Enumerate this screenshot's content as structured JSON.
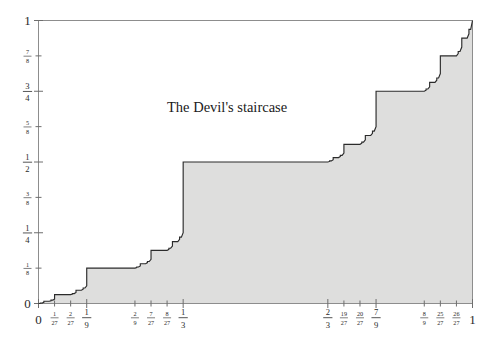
{
  "figure": {
    "title": "The Devil's staircase",
    "background_color": "#ffffff",
    "fill_color": "#dededd",
    "curve_color": "#2b2b2b",
    "axis_color": "#8d8d8d"
  },
  "chart_data": {
    "type": "line",
    "title": "The Devil's staircase",
    "xlabel": "",
    "ylabel": "",
    "xlim": [
      0,
      1
    ],
    "ylim": [
      0,
      1
    ],
    "grid": false,
    "legend": "none",
    "x_tick_labels": [
      "0",
      "1/27",
      "2/27",
      "1/9",
      "2/9",
      "7/27",
      "8/27",
      "1/3",
      "2/3",
      "19/27",
      "20/27",
      "7/9",
      "8/9",
      "25/27",
      "26/27",
      "1"
    ],
    "x_tick_values": [
      0,
      0.037037,
      0.074074,
      0.111111,
      0.222222,
      0.259259,
      0.296296,
      0.333333,
      0.666667,
      0.703704,
      0.740741,
      0.777778,
      0.888889,
      0.925926,
      0.962963,
      1
    ],
    "y_tick_labels": [
      "0",
      "1/8",
      "1/4",
      "3/8",
      "1/2",
      "5/8",
      "3/4",
      "7/8",
      "1"
    ],
    "y_tick_values": [
      0,
      0.125,
      0.25,
      0.375,
      0.5,
      0.625,
      0.75,
      0.875,
      1
    ],
    "plateaus": [
      {
        "x_start": 0.333333,
        "x_end": 0.666667,
        "y": 0.5
      },
      {
        "x_start": 0.111111,
        "x_end": 0.222222,
        "y": 0.25
      },
      {
        "x_start": 0.777778,
        "x_end": 0.888889,
        "y": 0.75
      },
      {
        "x_start": 0.037037,
        "x_end": 0.074074,
        "y": 0.125
      },
      {
        "x_start": 0.259259,
        "x_end": 0.296296,
        "y": 0.375
      },
      {
        "x_start": 0.703704,
        "x_end": 0.740741,
        "y": 0.625
      },
      {
        "x_start": 0.925926,
        "x_end": 0.962963,
        "y": 0.875
      }
    ],
    "series": [
      {
        "name": "Cantor function",
        "x": [
          0,
          1
        ],
        "y": [
          0,
          1
        ]
      }
    ]
  },
  "axes": {
    "y_ticks": [
      {
        "label": "0",
        "value": 0,
        "style": "whole"
      },
      {
        "label": "1/8",
        "num": "1",
        "den": "8",
        "value": 0.125,
        "style": "frac-small"
      },
      {
        "label": "1/4",
        "num": "1",
        "den": "4",
        "value": 0.25,
        "style": "frac-big"
      },
      {
        "label": "3/8",
        "num": "3",
        "den": "8",
        "value": 0.375,
        "style": "frac-small"
      },
      {
        "label": "1/2",
        "num": "1",
        "den": "2",
        "value": 0.5,
        "style": "frac-big"
      },
      {
        "label": "5/8",
        "num": "5",
        "den": "8",
        "value": 0.625,
        "style": "frac-small"
      },
      {
        "label": "3/4",
        "num": "3",
        "den": "4",
        "value": 0.75,
        "style": "frac-big"
      },
      {
        "label": "7/8",
        "num": "7",
        "den": "8",
        "value": 0.875,
        "style": "frac-small"
      },
      {
        "label": "1",
        "value": 1,
        "style": "whole"
      }
    ],
    "x_ticks": [
      {
        "label": "0",
        "value": 0,
        "style": "whole"
      },
      {
        "label": "1/27",
        "num": "1",
        "den": "27",
        "value": 0.037037,
        "style": "frac-small"
      },
      {
        "label": "2/27",
        "num": "2",
        "den": "27",
        "value": 0.074074,
        "style": "frac-small"
      },
      {
        "label": "1/9",
        "num": "1",
        "den": "9",
        "value": 0.111111,
        "style": "frac-big"
      },
      {
        "label": "2/9",
        "num": "2",
        "den": "9",
        "value": 0.222222,
        "style": "frac-small"
      },
      {
        "label": "7/27",
        "num": "7",
        "den": "27",
        "value": 0.259259,
        "style": "frac-small"
      },
      {
        "label": "8/27",
        "num": "8",
        "den": "27",
        "value": 0.296296,
        "style": "frac-small"
      },
      {
        "label": "1/3",
        "num": "1",
        "den": "3",
        "value": 0.333333,
        "style": "frac-big"
      },
      {
        "label": "2/3",
        "num": "2",
        "den": "3",
        "value": 0.666667,
        "style": "frac-big"
      },
      {
        "label": "19/27",
        "num": "19",
        "den": "27",
        "value": 0.703704,
        "style": "frac-small"
      },
      {
        "label": "20/27",
        "num": "20",
        "den": "27",
        "value": 0.740741,
        "style": "frac-small"
      },
      {
        "label": "7/9",
        "num": "7",
        "den": "9",
        "value": 0.777778,
        "style": "frac-big"
      },
      {
        "label": "8/9",
        "num": "8",
        "den": "9",
        "value": 0.888889,
        "style": "frac-small"
      },
      {
        "label": "25/27",
        "num": "25",
        "den": "27",
        "value": 0.925926,
        "style": "frac-small"
      },
      {
        "label": "26/27",
        "num": "26",
        "den": "27",
        "value": 0.962963,
        "style": "frac-small"
      },
      {
        "label": "1",
        "value": 1,
        "style": "whole"
      }
    ]
  }
}
